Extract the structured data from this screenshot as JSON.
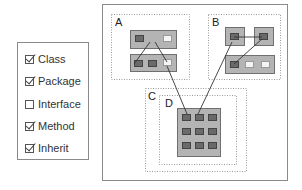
{
  "legend": {
    "items": [
      {
        "label": "Class",
        "checked": true
      },
      {
        "label": "Package",
        "checked": true
      },
      {
        "label": "Interface",
        "checked": false
      },
      {
        "label": "Method",
        "checked": true
      },
      {
        "label": "Inherit",
        "checked": true
      }
    ]
  },
  "diagram": {
    "packages": [
      {
        "label": "A"
      },
      {
        "label": "B"
      },
      {
        "label": "C"
      },
      {
        "label": "D"
      }
    ]
  },
  "colors": {
    "class_fill": "#b4b4b4",
    "method_fill": "#6a6a6a",
    "border": "#6f6f6f",
    "dotted": "#9a9a9a"
  }
}
